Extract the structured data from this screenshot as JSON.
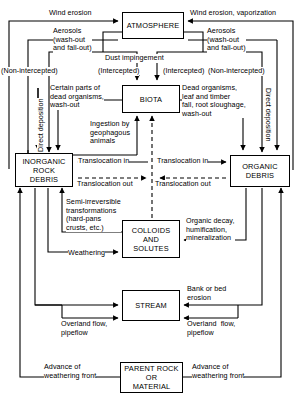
{
  "diagram": {
    "nodes": [
      {
        "id": "atmosphere",
        "label": "ATMOSPHERE"
      },
      {
        "id": "biota",
        "label": "BIOTA"
      },
      {
        "id": "inorganic",
        "label": "INORGANIC\nROCK\nDEBRIS"
      },
      {
        "id": "organic",
        "label": "ORGANIC\nDEBRIS"
      },
      {
        "id": "colloids",
        "label": "COLLOIDS\nAND\nSOLUTES"
      },
      {
        "id": "stream",
        "label": "STREAM"
      },
      {
        "id": "parent",
        "label": "PARENT ROCK\nOR\nMATERIAL"
      }
    ],
    "labels": {
      "wind_erosion_left": "Wind erosion",
      "wind_erosion_right": "Wind erosion, vaporization",
      "aerosols_left": "Aerosols\n(wash-out\nand fall-out)",
      "aerosols_right": "Aerosols\n(wash-out\nand fall-out)",
      "non_intercepted_left": "(Non-intercepted)",
      "intercepted_left": "(Intercepted)",
      "dust_impingement": "Dust impingement",
      "intercepted_right": "(Intercepted)",
      "non_intercepted_right": "(Non-intercepted)",
      "direct_deposition_left": "Direct deposition",
      "direct_deposition_right": "Direct deposition",
      "certain_parts": "Certain parts of\ndead organisms,\nwash-out",
      "dead_organisms": "Dead organisms,\nleaf and timber\nfall, root sloughage,\nwash-out",
      "ingestion": "Ingestion by\ngeophagous\nanimals",
      "translocation_in_left": "Translocation in",
      "translocation_out_left": "Translocation out",
      "translocation_in_right": "Translocation in",
      "translocation_out_right": "Translocation out",
      "semi_irreversible": "Semi-irreversible\ntransformations\n(hard-pans\ncrusts, etc.)",
      "organic_decay": "Organic decay,\nhumification,\nmineralization",
      "weathering": "Weathering",
      "bank_or_bed": "Bank or bed\nerosion",
      "overland_flow_left": "Overland flow,\npipeflow",
      "overland_flow_right": "Overland  flow,\npipeflow",
      "advance_left": "Advance of\nweathering front",
      "advance_right": "Advance of\nweathering front"
    }
  }
}
